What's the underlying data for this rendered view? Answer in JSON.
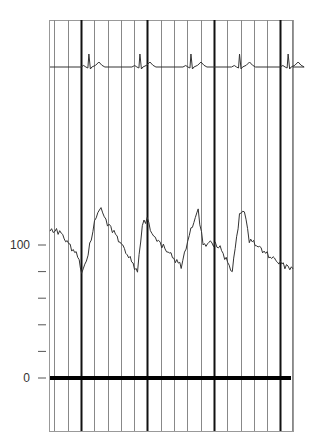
{
  "chart_data": {
    "type": "line",
    "title": "",
    "xlabel": "",
    "ylabel": "",
    "grid": {
      "vertical": true,
      "horizontal": false,
      "major_every": 5
    },
    "y_axis": {
      "ticks": [
        0,
        20,
        40,
        60,
        80,
        100
      ],
      "tick_labels": {
        "0": "0",
        "100": "100"
      },
      "range": [
        -40,
        270
      ]
    },
    "series": [
      {
        "name": "ECG",
        "description": "Electrocardiogram trace in upper strip (no calibrated scale)",
        "r_peak_x_fraction": [
          0.16,
          0.37,
          0.58,
          0.78,
          0.98
        ],
        "baseline_relative": 0,
        "r_peak_relative": 1
      },
      {
        "name": "Arterial pressure",
        "units": "mmHg",
        "x_fraction": [
          0.0,
          0.04,
          0.12,
          0.13,
          0.15,
          0.19,
          0.21,
          0.23,
          0.27,
          0.36,
          0.38,
          0.4,
          0.42,
          0.44,
          0.48,
          0.54,
          0.58,
          0.61,
          0.63,
          0.66,
          0.7,
          0.75,
          0.78,
          0.8,
          0.82,
          0.85,
          0.9,
          0.96,
          1.0
        ],
        "values": [
          111,
          110,
          90,
          79,
          88,
          122,
          128,
          118,
          108,
          80,
          115,
          120,
          108,
          104,
          96,
          84,
          112,
          126,
          100,
          102,
          98,
          80,
          123,
          126,
          104,
          100,
          92,
          85,
          82
        ]
      }
    ]
  },
  "axis_labels": {
    "y_top": "100",
    "y_zero": "0"
  },
  "colors": {
    "trace": "#333333",
    "grid_minor": "#888888",
    "grid_major": "#111111",
    "baseline": "#000000",
    "background": "#ffffff"
  }
}
